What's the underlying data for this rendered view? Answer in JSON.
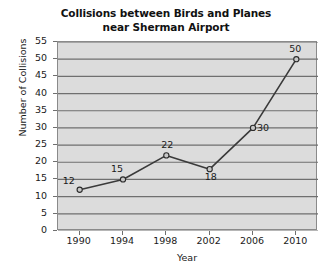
{
  "chart_data": {
    "type": "line",
    "title": "Collisions between Birds and Planes\nnear Sherman Airport",
    "title_line1": "Collisions between Birds and Planes",
    "title_line2": "near Sherman Airport",
    "xlabel": "Year",
    "ylabel": "Number of Collisions",
    "categories": [
      1990,
      1994,
      1998,
      2002,
      2006,
      2010
    ],
    "x": [
      1990,
      1994,
      1998,
      2002,
      2006,
      2010
    ],
    "values": [
      12,
      15,
      22,
      18,
      30,
      50
    ],
    "point_labels": [
      "12",
      "15",
      "22",
      "18",
      "30",
      "50"
    ],
    "xtick_labels": [
      "1990",
      "1994",
      "1998",
      "2002",
      "2006",
      "2010"
    ],
    "ytick_labels": [
      "0",
      "5",
      "10",
      "15",
      "20",
      "25",
      "30",
      "35",
      "40",
      "45",
      "50",
      "55"
    ],
    "yticks": [
      0,
      5,
      10,
      15,
      20,
      25,
      30,
      35,
      40,
      45,
      50,
      55
    ],
    "ylim": [
      0,
      55
    ],
    "xlim": [
      1988,
      2012
    ],
    "grid": "horizontal",
    "legend": "none",
    "colors": {
      "plot_background": "#dcdcdc",
      "gridline": "#6f6f6f",
      "axis": "#8a8a8a",
      "line": "#3a3a3a",
      "marker_fill": "#c8c8c8",
      "marker_edge": "#2b2b2b",
      "text": "#1a1a1a",
      "page_background": "#ffffff"
    }
  }
}
